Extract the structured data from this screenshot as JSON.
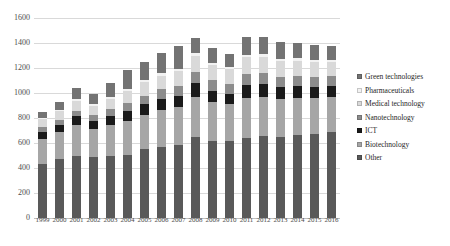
{
  "chart_data": {
    "type": "bar",
    "stacked": true,
    "title": "",
    "xlabel": "",
    "ylabel": "",
    "ylim": [
      0,
      1600
    ],
    "ytick_step": 200,
    "yticks": [
      0,
      200,
      400,
      600,
      800,
      1000,
      1200,
      1400,
      1600
    ],
    "grid": true,
    "legend_position": "right",
    "categories": [
      "1999",
      "2000",
      "2001",
      "2002",
      "2003",
      "2004",
      "2005",
      "2006",
      "2007",
      "2008",
      "2009",
      "2010",
      "2011",
      "2012",
      "2013",
      "2014",
      "2015",
      "2016"
    ],
    "series": [
      {
        "name": "Other",
        "color": "#595959",
        "values": [
          430,
          470,
          500,
          490,
          500,
          505,
          550,
          570,
          585,
          650,
          620,
          620,
          640,
          660,
          650,
          665,
          670,
          690
        ]
      },
      {
        "name": "Biotechnology",
        "color": "#a6a6a6",
        "values": [
          200,
          215,
          245,
          225,
          245,
          270,
          275,
          295,
          300,
          320,
          305,
          290,
          320,
          310,
          300,
          295,
          290,
          280
        ]
      },
      {
        "name": "ICT",
        "color": "#1a1a1a",
        "values": [
          55,
          60,
          70,
          65,
          70,
          80,
          85,
          90,
          95,
          110,
          95,
          85,
          105,
          100,
          95,
          95,
          90,
          90
        ]
      },
      {
        "name": "Nanotechnology",
        "color": "#8c8c8c",
        "values": [
          40,
          40,
          45,
          45,
          55,
          65,
          70,
          75,
          80,
          90,
          85,
          80,
          90,
          90,
          85,
          80,
          80,
          75
        ]
      },
      {
        "name": "Medical technology",
        "color": "#d9d9d9",
        "values": [
          65,
          70,
          80,
          75,
          85,
          100,
          105,
          110,
          115,
          130,
          120,
          115,
          130,
          130,
          125,
          125,
          120,
          115
        ]
      },
      {
        "name": "Pharmaceuticals",
        "color": "#f2f2f2",
        "values": [
          10,
          10,
          12,
          12,
          14,
          16,
          16,
          18,
          18,
          20,
          18,
          16,
          20,
          20,
          18,
          18,
          18,
          16
        ]
      },
      {
        "name": "Green technologies",
        "color": "#737373",
        "values": [
          50,
          65,
          85,
          80,
          110,
          145,
          150,
          165,
          180,
          120,
          115,
          105,
          145,
          140,
          135,
          125,
          120,
          110
        ]
      }
    ],
    "totals": [
      850,
      930,
      1037,
      992,
      1079,
      1181,
      1251,
      1323,
      1373,
      1440,
      1358,
      1311,
      1450,
      1450,
      1408,
      1403,
      1388,
      1376
    ]
  },
  "legend": {
    "items": [
      {
        "label": "Green technologies",
        "color": "#737373"
      },
      {
        "label": "Pharmaceuticals",
        "color": "#f2f2f2"
      },
      {
        "label": "Medical technology",
        "color": "#d9d9d9"
      },
      {
        "label": "Nanotechnology",
        "color": "#8c8c8c"
      },
      {
        "label": "ICT",
        "color": "#1a1a1a"
      },
      {
        "label": "Biotechnology",
        "color": "#a6a6a6"
      },
      {
        "label": "Other",
        "color": "#595959"
      }
    ]
  }
}
